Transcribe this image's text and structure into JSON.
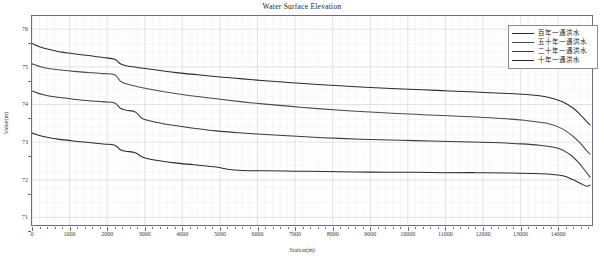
{
  "chart_data": {
    "type": "line",
    "title": "Water Surface Elevation",
    "xlabel": "Station(m)",
    "ylabel": "Value(m)",
    "xlim": [
      0,
      14900
    ],
    "ylim": [
      70.8,
      76.35
    ],
    "grid": true,
    "legend_position": "top-right",
    "xticks": [
      0,
      1000,
      2000,
      3000,
      4000,
      5000,
      6000,
      7000,
      8000,
      9000,
      10000,
      11000,
      12000,
      13000,
      14000
    ],
    "yticks": [
      71,
      72,
      73,
      74,
      75,
      76
    ],
    "series": [
      {
        "name": "百年一遇洪水",
        "color": "#2b2b2b",
        "x": [
          0,
          300,
          700,
          1100,
          1500,
          1900,
          2200,
          2350,
          2500,
          2900,
          3400,
          3900,
          4400,
          5000,
          5600,
          6200,
          6900,
          7600,
          8300,
          9000,
          9700,
          10400,
          11100,
          11800,
          12500,
          13100,
          13700,
          14100,
          14400,
          14600,
          14750,
          14850
        ],
        "y": [
          75.62,
          75.5,
          75.41,
          75.35,
          75.3,
          75.25,
          75.2,
          75.08,
          75.03,
          74.97,
          74.9,
          74.84,
          74.79,
          74.73,
          74.68,
          74.63,
          74.58,
          74.53,
          74.49,
          74.45,
          74.42,
          74.39,
          74.36,
          74.33,
          74.3,
          74.27,
          74.2,
          74.08,
          73.9,
          73.72,
          73.55,
          73.46
        ]
      },
      {
        "name": "五十年一遇洪水",
        "color": "#4a4a4a",
        "x": [
          0,
          300,
          700,
          1100,
          1500,
          1900,
          2200,
          2350,
          2500,
          2900,
          3400,
          3900,
          4400,
          5000,
          5600,
          6200,
          6900,
          7600,
          8300,
          9000,
          9700,
          10400,
          11100,
          11800,
          12500,
          13100,
          13700,
          14100,
          14400,
          14600,
          14750,
          14850
        ],
        "y": [
          75.08,
          74.98,
          74.92,
          74.88,
          74.85,
          74.82,
          74.79,
          74.62,
          74.55,
          74.45,
          74.36,
          74.28,
          74.21,
          74.14,
          74.07,
          74.01,
          73.95,
          73.89,
          73.84,
          73.8,
          73.76,
          73.73,
          73.7,
          73.67,
          73.63,
          73.58,
          73.5,
          73.36,
          73.15,
          72.96,
          72.78,
          72.68
        ]
      },
      {
        "name": "二十年一遇洪水",
        "color": "#3a3a3a",
        "x": [
          0,
          300,
          700,
          1100,
          1500,
          1900,
          2200,
          2350,
          2500,
          2750,
          2950,
          3300,
          3800,
          4300,
          4900,
          5500,
          6100,
          6800,
          7500,
          8200,
          9000,
          9800,
          10600,
          11400,
          12200,
          12900,
          13500,
          14000,
          14300,
          14550,
          14750,
          14850
        ],
        "y": [
          74.36,
          74.26,
          74.19,
          74.14,
          74.1,
          74.07,
          74.04,
          73.9,
          73.85,
          73.8,
          73.62,
          73.53,
          73.44,
          73.37,
          73.3,
          73.25,
          73.21,
          73.17,
          73.13,
          73.1,
          73.07,
          73.05,
          73.03,
          73.01,
          72.99,
          72.96,
          72.92,
          72.84,
          72.68,
          72.45,
          72.2,
          72.07
        ]
      },
      {
        "name": "十年一遇洪水",
        "color": "#2b2b2b",
        "x": [
          0,
          300,
          700,
          1100,
          1500,
          1900,
          2200,
          2350,
          2500,
          2750,
          2950,
          3300,
          3800,
          4300,
          4900,
          5200,
          5600,
          6200,
          7000,
          7800,
          8600,
          9400,
          10200,
          11000,
          11800,
          12600,
          13300,
          13800,
          14150,
          14400,
          14600,
          14750,
          14850
        ],
        "y": [
          73.24,
          73.15,
          73.08,
          73.03,
          72.99,
          72.95,
          72.92,
          72.8,
          72.76,
          72.72,
          72.6,
          72.52,
          72.45,
          72.4,
          72.34,
          72.28,
          72.25,
          72.24,
          72.23,
          72.22,
          72.21,
          72.2,
          72.2,
          72.19,
          72.19,
          72.18,
          72.17,
          72.15,
          72.1,
          72.0,
          71.9,
          71.83,
          71.86
        ]
      }
    ]
  },
  "legend": {
    "items": [
      {
        "label": "百年一遇洪水",
        "color": "#2b2b2b"
      },
      {
        "label": "五十年一遇洪水",
        "color": "#4a4a4a"
      },
      {
        "label": "二十年一遇洪水",
        "color": "#3a3a3a"
      },
      {
        "label": "十年一遇洪水",
        "color": "#2b2b2b"
      }
    ]
  },
  "colors": {
    "grid_minor": "#e9e9f2",
    "grid_major": "#cfcfe0",
    "axis": "#6d6d78",
    "text": "#1a1a1a"
  }
}
